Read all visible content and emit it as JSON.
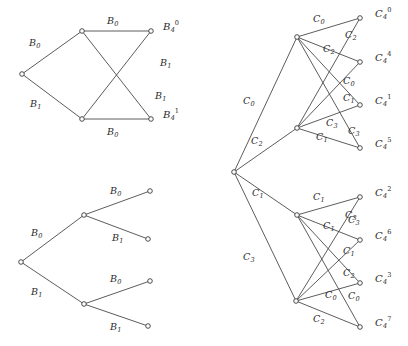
{
  "figure": {
    "background": "#ffffff",
    "edge_color": "#4a4a4a",
    "node_stroke": "#3a3a3a",
    "node_fill": "#ffffff",
    "width": 408,
    "height": 346
  },
  "panels": {
    "top_left": {
      "name": "B-graph",
      "nodes": [
        {
          "id": "b_left",
          "x": 22,
          "y": 74
        },
        {
          "id": "b_top",
          "x": 82,
          "y": 31
        },
        {
          "id": "b_bot",
          "x": 82,
          "y": 119
        },
        {
          "id": "b_tr",
          "x": 151,
          "y": 31
        },
        {
          "id": "b_br",
          "x": 151,
          "y": 119
        }
      ],
      "edges": [
        {
          "from": "b_left",
          "to": "b_top",
          "label": "B0"
        },
        {
          "from": "b_left",
          "to": "b_bot",
          "label": "B1"
        },
        {
          "from": "b_top",
          "to": "b_tr",
          "label": "B0"
        },
        {
          "from": "b_top",
          "to": "b_br",
          "label": "B1"
        },
        {
          "from": "b_bot",
          "to": "b_tr",
          "label": "B1"
        },
        {
          "from": "b_bot",
          "to": "b_br",
          "label": "B0"
        }
      ],
      "edge_labels": [
        {
          "text": "B",
          "sub": "0",
          "x": 29,
          "y": 38
        },
        {
          "text": "B",
          "sub": "1",
          "x": 30,
          "y": 99
        },
        {
          "text": "B",
          "sub": "0",
          "x": 107,
          "y": 16
        },
        {
          "text": "B",
          "sub": "1",
          "x": 160,
          "y": 58
        },
        {
          "text": "B",
          "sub": "1",
          "x": 155,
          "y": 91
        },
        {
          "text": "B",
          "sub": "0",
          "x": 107,
          "y": 127
        }
      ],
      "node_labels": [
        {
          "text": "B",
          "sub": "4",
          "sup": "0",
          "x": 163,
          "y": 22
        },
        {
          "text": "B",
          "sub": "4",
          "sup": "1",
          "x": 163,
          "y": 110
        }
      ]
    },
    "bottom_left": {
      "name": "B-tree",
      "nodes": [
        {
          "id": "t_root",
          "x": 21,
          "y": 262
        },
        {
          "id": "t_up",
          "x": 84,
          "y": 215
        },
        {
          "id": "t_dn",
          "x": 84,
          "y": 304
        },
        {
          "id": "t_l1",
          "x": 150,
          "y": 191
        },
        {
          "id": "t_l2",
          "x": 148,
          "y": 239
        },
        {
          "id": "t_l3",
          "x": 150,
          "y": 281
        },
        {
          "id": "t_l4",
          "x": 148,
          "y": 326
        }
      ],
      "edges": [
        {
          "from": "t_root",
          "to": "t_up",
          "label": "B0"
        },
        {
          "from": "t_root",
          "to": "t_dn",
          "label": "B1"
        },
        {
          "from": "t_up",
          "to": "t_l1",
          "label": "B0"
        },
        {
          "from": "t_up",
          "to": "t_l2",
          "label": "B1"
        },
        {
          "from": "t_dn",
          "to": "t_l3",
          "label": "B0"
        },
        {
          "from": "t_dn",
          "to": "t_l4",
          "label": "B1"
        }
      ],
      "edge_labels": [
        {
          "text": "B",
          "sub": "0",
          "x": 31,
          "y": 228
        },
        {
          "text": "B",
          "sub": "1",
          "x": 31,
          "y": 287
        },
        {
          "text": "B",
          "sub": "0",
          "x": 110,
          "y": 186
        },
        {
          "text": "B",
          "sub": "1",
          "x": 112,
          "y": 233
        },
        {
          "text": "B",
          "sub": "0",
          "x": 110,
          "y": 274
        },
        {
          "text": "B",
          "sub": "1",
          "x": 110,
          "y": 322
        }
      ]
    },
    "right": {
      "name": "C-graph",
      "nodes": [
        {
          "id": "c_root",
          "x": 234,
          "y": 172
        },
        {
          "id": "c_hub_a",
          "x": 297,
          "y": 37
        },
        {
          "id": "c_hub_b",
          "x": 297,
          "y": 128
        },
        {
          "id": "c_hub_c",
          "x": 297,
          "y": 215
        },
        {
          "id": "c_hub_d",
          "x": 296,
          "y": 301
        },
        {
          "id": "c_leaf0",
          "x": 360,
          "y": 18
        },
        {
          "id": "c_leaf4",
          "x": 360,
          "y": 62
        },
        {
          "id": "c_leaf1",
          "x": 360,
          "y": 105
        },
        {
          "id": "c_leaf5",
          "x": 360,
          "y": 148
        },
        {
          "id": "c_leaf2",
          "x": 360,
          "y": 197
        },
        {
          "id": "c_leaf6",
          "x": 360,
          "y": 240
        },
        {
          "id": "c_leaf3",
          "x": 360,
          "y": 283
        },
        {
          "id": "c_leaf7",
          "x": 360,
          "y": 327
        }
      ],
      "edges": [
        {
          "from": "c_root",
          "to": "c_hub_a",
          "label": "C0"
        },
        {
          "from": "c_root",
          "to": "c_hub_b",
          "label": "C2"
        },
        {
          "from": "c_root",
          "to": "c_hub_c",
          "label": "C1"
        },
        {
          "from": "c_root",
          "to": "c_hub_d",
          "label": "C3"
        },
        {
          "from": "c_hub_a",
          "to": "c_leaf0",
          "label": "C0"
        },
        {
          "from": "c_hub_a",
          "to": "c_leaf4",
          "label": "C2"
        },
        {
          "from": "c_hub_a",
          "to": "c_leaf1",
          "label": "C1"
        },
        {
          "from": "c_hub_a",
          "to": "c_leaf5",
          "label": "C3"
        },
        {
          "from": "c_hub_b",
          "to": "c_leaf0",
          "label": "C2"
        },
        {
          "from": "c_hub_b",
          "to": "c_leaf4",
          "label": "C0"
        },
        {
          "from": "c_hub_b",
          "to": "c_leaf1",
          "label": "C1"
        },
        {
          "from": "c_hub_b",
          "to": "c_leaf5",
          "label": "C3"
        },
        {
          "from": "c_hub_c",
          "to": "c_leaf2",
          "label": "C1"
        },
        {
          "from": "c_hub_c",
          "to": "c_leaf6",
          "label": "C3"
        },
        {
          "from": "c_hub_c",
          "to": "c_leaf3",
          "label": "C2"
        },
        {
          "from": "c_hub_c",
          "to": "c_leaf7",
          "label": "C0"
        },
        {
          "from": "c_hub_d",
          "to": "c_leaf2",
          "label": "C3"
        },
        {
          "from": "c_hub_d",
          "to": "c_leaf6",
          "label": "C1"
        },
        {
          "from": "c_hub_d",
          "to": "c_leaf3",
          "label": "C0"
        },
        {
          "from": "c_hub_d",
          "to": "c_leaf7",
          "label": "C2"
        }
      ],
      "edge_labels": [
        {
          "text": "C",
          "sub": "0",
          "x": 243,
          "y": 96
        },
        {
          "text": "C",
          "sub": "2",
          "x": 251,
          "y": 136
        },
        {
          "text": "C",
          "sub": "1",
          "x": 252,
          "y": 188
        },
        {
          "text": "C",
          "sub": "3",
          "x": 243,
          "y": 252
        },
        {
          "text": "C",
          "sub": "0",
          "x": 313,
          "y": 14
        },
        {
          "text": "C",
          "sub": "2",
          "x": 323,
          "y": 44
        },
        {
          "text": "C",
          "sub": "2",
          "x": 345,
          "y": 30
        },
        {
          "text": "C",
          "sub": "0",
          "x": 343,
          "y": 76
        },
        {
          "text": "C",
          "sub": "1",
          "x": 343,
          "y": 93
        },
        {
          "text": "C",
          "sub": "3",
          "x": 326,
          "y": 118
        },
        {
          "text": "C",
          "sub": "1",
          "x": 316,
          "y": 132
        },
        {
          "text": "C",
          "sub": "3",
          "x": 348,
          "y": 126
        },
        {
          "text": "C",
          "sub": "1",
          "x": 313,
          "y": 192
        },
        {
          "text": "C",
          "sub": "1",
          "x": 323,
          "y": 221
        },
        {
          "text": "C",
          "sub": "3",
          "x": 345,
          "y": 210
        },
        {
          "text": "C",
          "sub": "1",
          "x": 343,
          "y": 246
        },
        {
          "text": "C",
          "sub": "2",
          "x": 343,
          "y": 268
        },
        {
          "text": "C",
          "sub": "3",
          "x": 348,
          "y": 215
        },
        {
          "text": "C",
          "sub": "0",
          "x": 325,
          "y": 290
        },
        {
          "text": "C",
          "sub": "0",
          "x": 348,
          "y": 291
        },
        {
          "text": "C",
          "sub": "2",
          "x": 313,
          "y": 314
        }
      ],
      "node_labels": [
        {
          "text": "C",
          "sub": "4",
          "sup": "0",
          "x": 375,
          "y": 9
        },
        {
          "text": "C",
          "sub": "4",
          "sup": "4",
          "x": 375,
          "y": 53
        },
        {
          "text": "C",
          "sub": "4",
          "sup": "1",
          "x": 375,
          "y": 96
        },
        {
          "text": "C",
          "sub": "4",
          "sup": "5",
          "x": 375,
          "y": 139
        },
        {
          "text": "C",
          "sub": "4",
          "sup": "2",
          "x": 375,
          "y": 188
        },
        {
          "text": "C",
          "sub": "4",
          "sup": "6",
          "x": 375,
          "y": 231
        },
        {
          "text": "C",
          "sub": "4",
          "sup": "3",
          "x": 375,
          "y": 274
        },
        {
          "text": "C",
          "sub": "4",
          "sup": "7",
          "x": 375,
          "y": 318
        }
      ]
    }
  }
}
